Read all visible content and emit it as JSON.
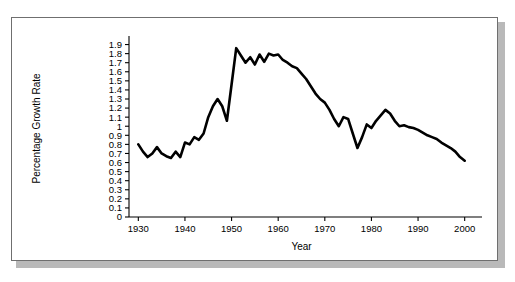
{
  "chart_data": {
    "type": "line",
    "title": "",
    "xlabel": "Year",
    "ylabel": "Percentage Growth Rate",
    "xlim": [
      1928,
      2002
    ],
    "ylim": [
      0,
      1.95
    ],
    "grid": false,
    "legend": "none",
    "xticks": [
      1930,
      1940,
      1950,
      1960,
      1970,
      1980,
      1990,
      2000
    ],
    "xtick_labels": [
      "1930",
      "1940",
      "1950",
      "1960",
      "1970",
      "1980",
      "1990",
      "2000"
    ],
    "yticks": [
      0,
      0.1,
      0.2,
      0.3,
      0.4,
      0.5,
      0.6,
      0.7,
      0.8,
      0.9,
      1,
      1.1,
      1.2,
      1.3,
      1.4,
      1.5,
      1.6,
      1.7,
      1.8,
      1.9
    ],
    "ytick_labels": [
      "0",
      "0.1",
      "0.2",
      "0.3",
      "0.4",
      "0.5",
      "0.6",
      "0.7",
      "0.8",
      "0.9",
      "1",
      "1.1",
      "1.2",
      "1.3",
      "1.4",
      "1.5",
      "1.6",
      "1.7",
      "1.8",
      "1.9"
    ],
    "line_color": "#000000",
    "line_width": 2.6,
    "series": [
      {
        "name": "Percentage Growth Rate",
        "x": [
          1930,
          1931,
          1932,
          1933,
          1934,
          1935,
          1936,
          1937,
          1938,
          1939,
          1940,
          1941,
          1942,
          1943,
          1944,
          1945,
          1946,
          1947,
          1948,
          1949,
          1950,
          1951,
          1952,
          1953,
          1954,
          1955,
          1956,
          1957,
          1958,
          1959,
          1960,
          1961,
          1962,
          1963,
          1964,
          1965,
          1966,
          1967,
          1968,
          1969,
          1970,
          1971,
          1972,
          1973,
          1974,
          1975,
          1976,
          1977,
          1978,
          1979,
          1980,
          1981,
          1982,
          1983,
          1984,
          1985,
          1986,
          1987,
          1988,
          1989,
          1990,
          1991,
          1992,
          1993,
          1994,
          1995,
          1996,
          1997,
          1998,
          1999,
          2000
        ],
        "values": [
          0.8,
          0.72,
          0.66,
          0.7,
          0.77,
          0.7,
          0.67,
          0.65,
          0.72,
          0.66,
          0.82,
          0.8,
          0.88,
          0.85,
          0.92,
          1.1,
          1.22,
          1.3,
          1.22,
          1.06,
          1.46,
          1.86,
          1.78,
          1.7,
          1.76,
          1.68,
          1.79,
          1.71,
          1.8,
          1.78,
          1.79,
          1.73,
          1.7,
          1.66,
          1.64,
          1.58,
          1.52,
          1.44,
          1.36,
          1.3,
          1.26,
          1.18,
          1.08,
          1.0,
          1.1,
          1.08,
          0.92,
          0.76,
          0.88,
          1.02,
          0.98,
          1.06,
          1.12,
          1.18,
          1.14,
          1.06,
          1.0,
          1.01,
          0.99,
          0.98,
          0.96,
          0.93,
          0.9,
          0.88,
          0.86,
          0.82,
          0.79,
          0.76,
          0.72,
          0.66,
          0.62
        ]
      }
    ]
  },
  "axes": {
    "xlabel": "Year",
    "ylabel": "Percentage Growth Rate"
  }
}
